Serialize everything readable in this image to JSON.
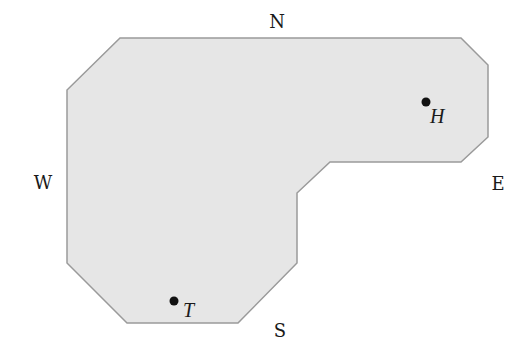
{
  "diagram": {
    "type": "floor-plan-region",
    "region": {
      "fill": "#e6e6e6",
      "stroke": "#9a9a9a",
      "vertices": [
        [
          120,
          38
        ],
        [
          461,
          38
        ],
        [
          488,
          65
        ],
        [
          488,
          137
        ],
        [
          461,
          162
        ],
        [
          330,
          162
        ],
        [
          297,
          193
        ],
        [
          297,
          263
        ],
        [
          238,
          323
        ],
        [
          127,
          323
        ],
        [
          67,
          263
        ],
        [
          67,
          90
        ]
      ]
    },
    "compass": {
      "north": {
        "label": "N",
        "x": 277,
        "y": 28
      },
      "south": {
        "label": "S",
        "x": 280,
        "y": 337
      },
      "west": {
        "label": "W",
        "x": 43,
        "y": 189
      },
      "east": {
        "label": "E",
        "x": 498,
        "y": 190
      }
    },
    "points": [
      {
        "id": "H",
        "label": "H",
        "dot": [
          426,
          102
        ],
        "label_pos": [
          430,
          123
        ]
      },
      {
        "id": "T",
        "label": "T",
        "dot": [
          174,
          301
        ],
        "label_pos": [
          183,
          317
        ]
      }
    ]
  }
}
